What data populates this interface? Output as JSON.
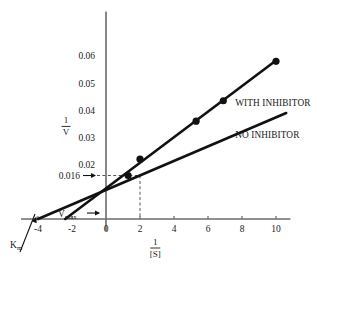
{
  "figure": {
    "kind": "lineweaver-burk-plot",
    "background": "#ffffff",
    "ink_color": "#111111",
    "axis_color": "#6b6b6b"
  },
  "axes": {
    "x_label_numerator": "1",
    "x_label_denominator": "[S]",
    "y_label_numerator": "1",
    "y_label_denominator": "V",
    "x_ticks": [
      "-4",
      "-2",
      "0",
      "2",
      "4",
      "6",
      "8",
      "10"
    ],
    "x_tick_values": [
      -4,
      -2,
      0,
      2,
      4,
      6,
      8,
      10
    ],
    "y_ticks": [
      "0.02",
      "0.03",
      "0.04",
      "0.05",
      "0.06"
    ],
    "y_tick_values": [
      0.02,
      0.03,
      0.04,
      0.05,
      0.06
    ],
    "x_range": [
      -5,
      11
    ],
    "y_range": [
      0,
      0.065
    ],
    "grid": false
  },
  "annotations": {
    "km_label": "K",
    "km_subscript": "m",
    "vmax_label": "V",
    "vmax_subscript": "max",
    "highlight_y_value": "0.016",
    "highlight_y_numeric": 0.016,
    "highlight_x_numeric": 2
  },
  "legend": {
    "position": "inside-right",
    "entries": [
      {
        "label": "WITH INHIBITOR"
      },
      {
        "label": "NO INHIBITOR"
      }
    ]
  },
  "chart_data": {
    "type": "line",
    "title": "",
    "subtitle": "",
    "xlabel": "1/[S]",
    "ylabel": "1/V",
    "xlim": [
      -5,
      11
    ],
    "ylim": [
      0,
      0.065
    ],
    "grid": false,
    "legend_position": "inside-right",
    "annotations": [
      {
        "text": "Km",
        "target_x": -4,
        "target_y": 0,
        "note": "x-intercept of NO INHIBITOR line = -1/Km"
      },
      {
        "text": "Vmax",
        "target_x": 0,
        "target_y": 0.0,
        "note": "arrow to y-axis intercept region (1/Vmax)"
      },
      {
        "text": "0.016",
        "target_x": 2,
        "target_y": 0.016,
        "note": "dashed guide lines from y=0.016 across to x=2"
      }
    ],
    "series": [
      {
        "name": "WITH INHIBITOR",
        "x_intercept": -2.4,
        "y_intercept": 0.0,
        "slope": 0.0058,
        "line_x": [
          -2.4,
          10.0
        ],
        "line_y": [
          0.0,
          0.0583
        ],
        "markers": true,
        "x": [
          1.3,
          2.0,
          5.3,
          6.9,
          10.0
        ],
        "values": [
          0.016,
          0.022,
          0.036,
          0.0435,
          0.058
        ]
      },
      {
        "name": "NO INHIBITOR",
        "x_intercept": -4.0,
        "y_intercept": 0.0,
        "slope": 0.00375,
        "line_x": [
          -4.0,
          10.6
        ],
        "line_y": [
          0.0,
          0.039
        ],
        "markers": false,
        "x": [],
        "values": []
      }
    ]
  }
}
